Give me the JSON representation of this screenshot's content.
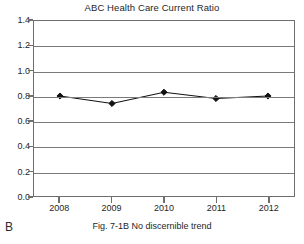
{
  "chart_data": {
    "type": "line",
    "title": "ABC Health Care Current Ratio",
    "xlabel": "",
    "ylabel": "",
    "categories": [
      "2008",
      "2009",
      "2010",
      "2011",
      "2012"
    ],
    "values": [
      0.8,
      0.74,
      0.83,
      0.78,
      0.8
    ],
    "series": [
      {
        "name": "Current Ratio",
        "values": [
          0.8,
          0.74,
          0.83,
          0.78,
          0.8
        ]
      }
    ],
    "ylim": [
      0.0,
      1.4
    ],
    "ytick_labels": [
      "0.0",
      "0.2",
      "0.4",
      "0.6",
      "0.8",
      "1.0",
      "1.2",
      "1.4"
    ],
    "ytick_values": [
      0.0,
      0.2,
      0.4,
      0.6,
      0.8,
      1.0,
      1.2,
      1.4
    ],
    "xtick_labels": [
      "2008",
      "2009",
      "2010",
      "2011",
      "2012"
    ],
    "grid": true,
    "grid_axis": "y",
    "legend": false,
    "legend_position": "none",
    "marker": "diamond",
    "line_color": "#111111",
    "marker_color": "#111111",
    "grid_color": "#7a7a7a",
    "frame_color": "#6e6e6e",
    "background": "#ffffff"
  },
  "figure": {
    "panel_letter": "B",
    "caption": "Fig. 7-1B No discernible trend"
  }
}
